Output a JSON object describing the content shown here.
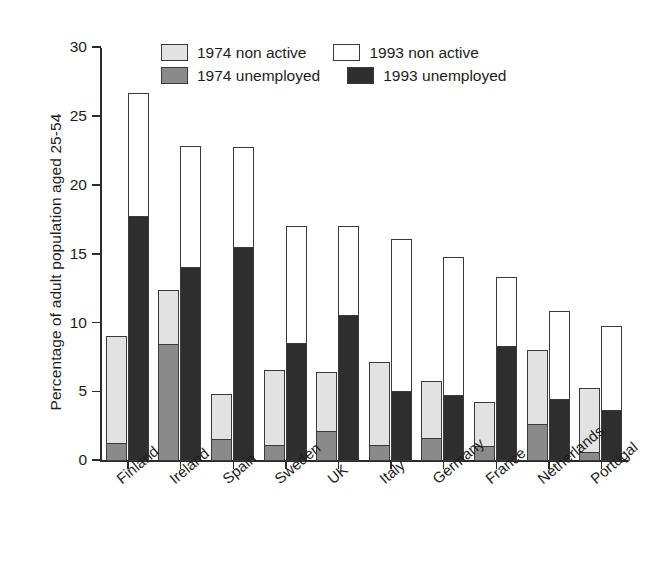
{
  "chart_data": {
    "type": "bar",
    "title": "",
    "subtitle": "",
    "xlabel": "",
    "ylabel": "Percentage of adult population aged 25-54",
    "ylim": [
      0,
      30
    ],
    "yticks": [
      "0",
      "5",
      "10",
      "15",
      "20",
      "25",
      "30"
    ],
    "ytick_values": [
      0,
      5,
      10,
      15,
      20,
      25,
      30
    ],
    "grid": false,
    "legend_position": "top-center",
    "stacked": true,
    "grouped": true,
    "categories": [
      "Finland",
      "Ireland",
      "Spain",
      "Sweden",
      "UK",
      "Italy",
      "Germany",
      "France",
      "Netherlands",
      "Portugal"
    ],
    "series": [
      {
        "name": "1974 unemployed",
        "color": "#8a8a8a",
        "values": [
          1.2,
          8.4,
          1.5,
          1.1,
          2.1,
          1.1,
          1.6,
          1.0,
          2.6,
          0.6
        ]
      },
      {
        "name": "1974 non active",
        "color": "#e2e2e2",
        "values": [
          7.9,
          4.0,
          3.4,
          5.5,
          4.4,
          6.1,
          4.2,
          3.3,
          5.5,
          4.7
        ]
      },
      {
        "name": "1993 unemployed",
        "color": "#2e2e2e",
        "values": [
          17.7,
          14.0,
          15.5,
          8.5,
          10.5,
          5.0,
          4.7,
          8.3,
          4.4,
          3.6
        ]
      },
      {
        "name": "1993 non active",
        "color": "#ffffff",
        "values": [
          9.0,
          8.9,
          7.3,
          8.6,
          6.6,
          11.1,
          10.1,
          5.1,
          6.5,
          6.2
        ]
      }
    ],
    "bar_totals": {
      "1974": [
        9.1,
        12.4,
        4.9,
        6.6,
        6.5,
        7.2,
        5.8,
        4.3,
        8.1,
        5.3
      ],
      "1993": [
        26.7,
        22.9,
        22.8,
        17.1,
        17.1,
        16.1,
        14.8,
        13.4,
        10.9,
        9.8
      ]
    }
  },
  "legend": {
    "rows": [
      [
        {
          "label": "1974 non active",
          "swatch": "light-gray"
        },
        {
          "label": "1993 non active",
          "swatch": "white"
        }
      ],
      [
        {
          "label": "1974 unemployed",
          "swatch": "mid-gray"
        },
        {
          "label": "1993 unemployed",
          "swatch": "dark"
        }
      ]
    ]
  },
  "colors": {
    "non_active_1974": "#e2e2e2",
    "unemployed_1974": "#8a8a8a",
    "non_active_1993": "#ffffff",
    "unemployed_1993": "#2e2e2e",
    "axis": "#2b2b2b",
    "text": "#1c1c1c"
  }
}
